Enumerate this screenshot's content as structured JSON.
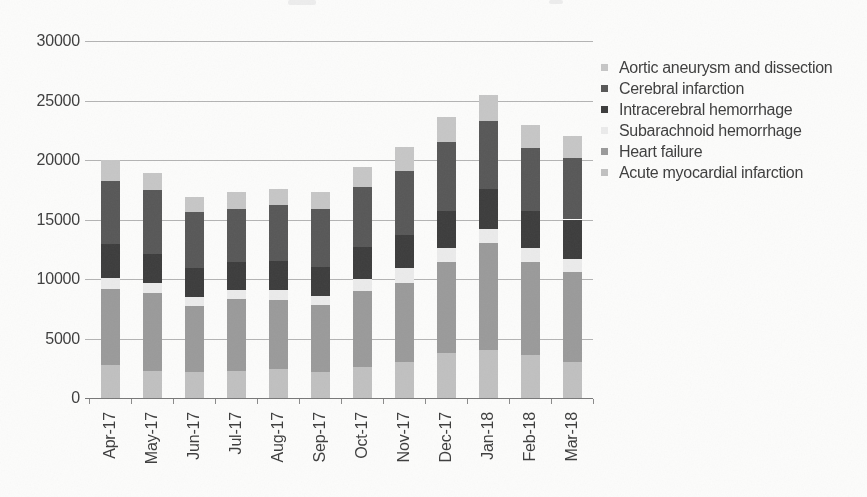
{
  "figure": {
    "background_color": "#fcfcfb",
    "text_color": "#3d3d3d",
    "gridline_color": "#b3b3b3",
    "axis_color": "#777777"
  },
  "y_axis": {
    "tick_labels": [
      "30000",
      "25000",
      "20000",
      "15000",
      "10000",
      "5000",
      "0"
    ]
  },
  "x_axis": {
    "tick_labels": [
      "Apr-17",
      "May-17",
      "Jun-17",
      "Jul-17",
      "Aug-17",
      "Sep-17",
      "Oct-17",
      "Nov-17",
      "Dec-17",
      "Jan-18",
      "Feb-18",
      "Mar-18"
    ]
  },
  "legend": {
    "position": "right",
    "items": [
      {
        "label": "Aortic aneurysm and dissection",
        "color": "#c6c6c6"
      },
      {
        "label": "Cerebral infarction",
        "color": "#575757"
      },
      {
        "label": "Intracerebral hemorrhage",
        "color": "#3c3c3c"
      },
      {
        "label": "Subarachnoid hemorrhage",
        "color": "#ebebeb"
      },
      {
        "label": "Heart failure",
        "color": "#9a9a9a"
      },
      {
        "label": "Acute myocardial infarction",
        "color": "#c0c0c0"
      }
    ]
  },
  "chart_data": {
    "type": "bar",
    "stacked": true,
    "title": "",
    "xlabel": "",
    "ylabel": "",
    "ylim": [
      0,
      30000
    ],
    "ytick_step": 5000,
    "grid": "horizontal",
    "legend_position": "right",
    "categories": [
      "Apr-17",
      "May-17",
      "Jun-17",
      "Jul-17",
      "Aug-17",
      "Sep-17",
      "Oct-17",
      "Nov-17",
      "Dec-17",
      "Jan-18",
      "Feb-18",
      "Mar-18"
    ],
    "series_order": "bottom-to-top",
    "series": [
      {
        "name": "Acute myocardial infarction",
        "color": "#c0c0c0",
        "values": [
          2800,
          2300,
          2200,
          2300,
          2400,
          2200,
          2600,
          3000,
          3800,
          4000,
          3600,
          3000
        ]
      },
      {
        "name": "Heart failure",
        "color": "#9a9a9a",
        "values": [
          6400,
          6500,
          5500,
          6000,
          5800,
          5600,
          6400,
          6700,
          7600,
          9000,
          7800,
          7600
        ]
      },
      {
        "name": "Subarachnoid hemorrhage",
        "color": "#ebebeb",
        "values": [
          900,
          900,
          800,
          800,
          900,
          800,
          1000,
          1200,
          1200,
          1200,
          1200,
          1100
        ]
      },
      {
        "name": "Intracerebral hemorrhage",
        "color": "#3c3c3c",
        "values": [
          2800,
          2400,
          2400,
          2300,
          2400,
          2400,
          2700,
          2800,
          3100,
          3400,
          3100,
          3300
        ]
      },
      {
        "name": "Cerebral infarction",
        "color": "#575757",
        "values": [
          5300,
          5400,
          4700,
          4500,
          4700,
          4900,
          5000,
          5400,
          5800,
          5700,
          5300,
          5200
        ]
      },
      {
        "name": "Aortic aneurysm and dissection",
        "color": "#c6c6c6",
        "values": [
          1800,
          1400,
          1300,
          1400,
          1400,
          1400,
          1700,
          2000,
          2100,
          2200,
          1900,
          1800
        ]
      }
    ],
    "totals": [
      20000,
      18900,
      16900,
      17300,
      17600,
      17300,
      19400,
      21100,
      23600,
      25500,
      22900,
      22000
    ]
  }
}
